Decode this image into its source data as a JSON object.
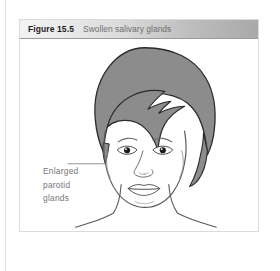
{
  "page": {
    "background_color": "#ffffff",
    "rule_color": "#e3e3e3"
  },
  "figure": {
    "border_color": "#dcdcdc",
    "caption": {
      "number": "Figure 15.5",
      "title": "Swollen salivary glands",
      "number_color": "#1d1d1d",
      "title_color": "#6f6f6f",
      "bar_gradient_from": "#f3f3f3",
      "bar_gradient_to": "#a9a9a9"
    },
    "illustration": {
      "subject": "frontal-female-face",
      "description": "Front view of a face with short gray hair showing bilaterally swollen parotid glands producing bulged cheeks and jaw contour",
      "hair_fill": "#8c8c8c",
      "hair_outline": "#2b2b2b",
      "skin_fill": "#ffffff",
      "line_color": "#555555",
      "pupil_color": "#1a1a1a",
      "parts": [
        "hair",
        "face-outline",
        "left-eye",
        "right-eye",
        "left-eyebrow",
        "right-eyebrow",
        "nose",
        "mouth",
        "chin",
        "neck",
        "shoulders",
        "swollen-parotid-left",
        "swollen-parotid-right"
      ]
    },
    "annotation": {
      "lines": [
        "Enlarged",
        "parotid",
        "glands"
      ],
      "text_color": "#777777",
      "leader_line_color": "#888888",
      "points_to": "swollen-parotid-left"
    }
  }
}
